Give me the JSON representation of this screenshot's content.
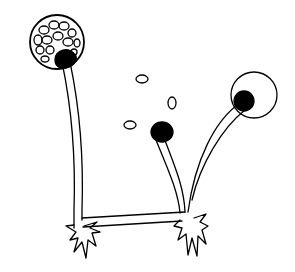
{
  "illustration": {
    "subject": "fungal sporangiophores with sporangia, spores and rhizoids",
    "colors": {
      "background": "#ffffff",
      "ink": "#000000"
    },
    "elements": {
      "sporangium_full": "sporangium filled with spores (left)",
      "sporangium_empty": "empty sporangium wall with columella (right)",
      "columella_burst": "columella after sporangium burst (middle)",
      "spores": 3,
      "stolon": "horizontal connecting hypha",
      "rhizoids": 2
    }
  }
}
